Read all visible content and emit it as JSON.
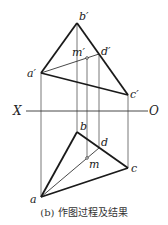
{
  "diagram": {
    "caption": "(b) 作图过程及结果",
    "axis": {
      "left_label": "X",
      "right_label": "O"
    },
    "front_view": {
      "points": {
        "a_prime": {
          "label": "a′",
          "x": 41,
          "y": 73
        },
        "b_prime": {
          "label": "b′",
          "x": 77,
          "y": 23
        },
        "c_prime": {
          "label": "c′",
          "x": 128,
          "y": 95
        },
        "d_prime": {
          "label": "d′",
          "x": 99,
          "y": 54
        },
        "m_prime": {
          "label": "m′",
          "x": 87,
          "y": 58
        }
      }
    },
    "top_view": {
      "points": {
        "a": {
          "label": "a",
          "x": 41,
          "y": 197
        },
        "b": {
          "label": "b",
          "x": 77,
          "y": 132
        },
        "c": {
          "label": "c",
          "x": 128,
          "y": 168
        },
        "d": {
          "label": "d",
          "x": 99,
          "y": 148
        },
        "m": {
          "label": "m",
          "x": 87,
          "y": 158
        }
      }
    },
    "colors": {
      "line": "#1a1a1a",
      "projector": "#555555"
    }
  }
}
